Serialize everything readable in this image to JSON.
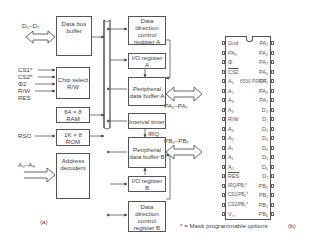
{
  "figure": {
    "part_a_label": "(a)",
    "part_b_label": "(b)",
    "footnote": "* = Mask programmable options"
  },
  "block_diagram": {
    "inputs": {
      "data_bus": "D₀–D₇",
      "cs1": "CS1*",
      "cs2": "CS2*",
      "phi2": "Φ2",
      "rw": "R/W",
      "res": "RES",
      "rso": "RSO",
      "address": "A₀–A₉"
    },
    "blocks": {
      "data_bus_buffer": "Data bus buffer",
      "chip_select": "Chip select R/W",
      "ram": "64 × 8 RAM",
      "rom": "1K × 8 ROM",
      "address_decoders": "Address decoders",
      "ddr_a": "Data direction control register A",
      "io_reg_a": "I/O register A",
      "pdb_a": "Peripheral data buffer A",
      "interval_timer": "Interval timer",
      "pdb_b": "Peripheral data buffer B",
      "io_reg_b": "I/O register B",
      "ddr_b": "Data direction control register B"
    },
    "outputs": {
      "port_a": "PA₀–PA₇",
      "port_b": "PB₀–PB₇",
      "irq": "IRQ"
    }
  },
  "pinout": {
    "chip_name": "6530 PRIOT",
    "left_pins": [
      "Gnd",
      "PA₀",
      "Φ",
      "CS2",
      "A₆",
      "A₅",
      "A₄",
      "A₃",
      "R/W",
      "A₈",
      "A₂",
      "A₇",
      "A₁",
      "A₀",
      "RES",
      "IRQ/PB₇*",
      "CS1/PB₆*",
      "CS2/PB₅*",
      "V꜀꜀"
    ],
    "right_pins": [
      "PA₁",
      "PA₂",
      "PA₃",
      "PA₄",
      "PA₅",
      "PA₆",
      "PA₇",
      "D₀",
      "D₁",
      "D₂",
      "D₃",
      "D₄",
      "D₅",
      "D₆",
      "D₇",
      "PB₀",
      "PB₁",
      "PB₂",
      "PB₄"
    ]
  },
  "colors": {
    "line": "#555555",
    "text": "#444444",
    "background": "#ffffff"
  }
}
